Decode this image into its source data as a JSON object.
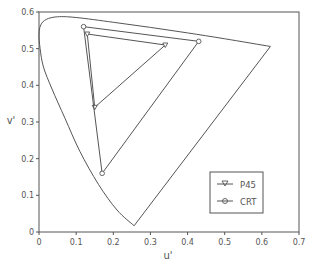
{
  "chart_data": {
    "type": "line",
    "title": "",
    "xlabel": "u'",
    "ylabel": "v'",
    "xlim": [
      0,
      0.7
    ],
    "ylim": [
      0,
      0.6
    ],
    "xticks": [
      0,
      0.1,
      0.2,
      0.3,
      0.4,
      0.5,
      0.6,
      0.7
    ],
    "yticks": [
      0,
      0.1,
      0.2,
      0.3,
      0.4,
      0.5,
      0.6
    ],
    "xtick_labels": [
      "0",
      "0.1",
      "0.2",
      "0.3",
      "0.4",
      "0.5",
      "0.6",
      "0.7"
    ],
    "ytick_labels": [
      "0",
      "0.1",
      "0.2",
      "0.3",
      "0.4",
      "0.5",
      "0.6"
    ],
    "grid": false,
    "legend_position": "lower right",
    "spectrum_locus": {
      "name": "CIE 1976 u'v' spectrum locus",
      "u": [
        0.256,
        0.21,
        0.16,
        0.11,
        0.07,
        0.035,
        0.012,
        0.003,
        0.0,
        0.005,
        0.02,
        0.05,
        0.1,
        0.2,
        0.3,
        0.4,
        0.5,
        0.623,
        0.256
      ],
      "v": [
        0.017,
        0.06,
        0.13,
        0.22,
        0.31,
        0.39,
        0.45,
        0.5,
        0.54,
        0.565,
        0.58,
        0.587,
        0.585,
        0.572,
        0.558,
        0.543,
        0.527,
        0.506,
        0.017
      ]
    },
    "series": [
      {
        "name": "P45",
        "marker": "triangle-down",
        "u": [
          0.13,
          0.34,
          0.15,
          0.13
        ],
        "v": [
          0.54,
          0.51,
          0.34,
          0.54
        ]
      },
      {
        "name": "CRT",
        "marker": "circle",
        "u": [
          0.12,
          0.43,
          0.17,
          0.12
        ],
        "v": [
          0.56,
          0.52,
          0.16,
          0.56
        ]
      }
    ]
  },
  "legend": {
    "items": [
      {
        "label": "P45"
      },
      {
        "label": "CRT"
      }
    ]
  },
  "axes": {
    "xlabel": "u'",
    "ylabel": "v'"
  }
}
